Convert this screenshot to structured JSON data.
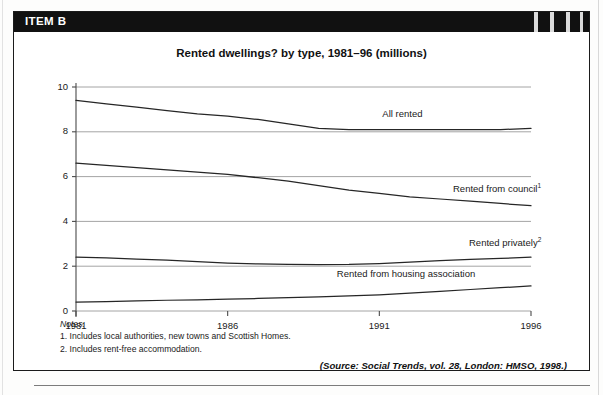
{
  "item": {
    "header_label": "ITEM B"
  },
  "notes": {
    "heading": "Notes:",
    "lines": [
      "1. Includes local authorities, new towns and Scottish Homes.",
      "2. Includes rent-free accommodation."
    ]
  },
  "source": {
    "text": "(Source: Social Trends, vol. 28, London: HMSO, 1998.)"
  },
  "colors": {
    "line": "#262626",
    "grid": "#9a9a9a",
    "axis": "#4a4a4a",
    "header_bar": "#111111",
    "header_text": "#ffffff",
    "box_border": "#1b1b1b"
  },
  "chart_data": {
    "type": "line",
    "title": "Rented dwellings? by type, 1981–96 (millions)",
    "xlabel": "",
    "ylabel": "",
    "xlim": [
      1981,
      1996
    ],
    "ylim": [
      0,
      10
    ],
    "yticks": [
      0,
      2,
      4,
      6,
      8,
      10
    ],
    "xticks": [
      1981,
      1986,
      1991,
      1996
    ],
    "xtick_labels": [
      "1981",
      "1986",
      "1991",
      "1996"
    ],
    "ytick_labels": [
      "0",
      "2",
      "4",
      "6",
      "8",
      "10"
    ],
    "grid": "horizontal",
    "legend": "inline-labels",
    "x": [
      1981,
      1982,
      1983,
      1984,
      1985,
      1986,
      1987,
      1988,
      1989,
      1990,
      1991,
      1992,
      1993,
      1994,
      1995,
      1996
    ],
    "series": [
      {
        "name": "All rented",
        "label": "All rented",
        "footnote": "",
        "label_x": 1991.1,
        "label_y": 8.75,
        "values": [
          9.4,
          9.25,
          9.1,
          8.95,
          8.8,
          8.7,
          8.55,
          8.35,
          8.15,
          8.1,
          8.1,
          8.1,
          8.1,
          8.1,
          8.1,
          8.15
        ]
      },
      {
        "name": "Rented from council",
        "label": "Rented from council",
        "footnote": "1",
        "label_x": 1993.0,
        "label_y": 5.45,
        "values": [
          6.6,
          6.5,
          6.4,
          6.3,
          6.2,
          6.1,
          5.95,
          5.8,
          5.6,
          5.4,
          5.25,
          5.1,
          5.0,
          4.9,
          4.8,
          4.7
        ]
      },
      {
        "name": "Rented privately",
        "label": "Rented privately",
        "footnote": "2",
        "label_x": 1993.0,
        "label_y": 3.05,
        "values": [
          2.4,
          2.37,
          2.32,
          2.27,
          2.2,
          2.14,
          2.1,
          2.08,
          2.07,
          2.08,
          2.12,
          2.18,
          2.25,
          2.3,
          2.35,
          2.4
        ]
      },
      {
        "name": "Rented from housing association",
        "label": "Rented from housing association",
        "footnote": "",
        "label_x": 1989.6,
        "label_y": 1.6,
        "values": [
          0.4,
          0.42,
          0.45,
          0.48,
          0.5,
          0.53,
          0.56,
          0.6,
          0.63,
          0.67,
          0.72,
          0.8,
          0.88,
          0.96,
          1.04,
          1.12
        ]
      }
    ]
  }
}
